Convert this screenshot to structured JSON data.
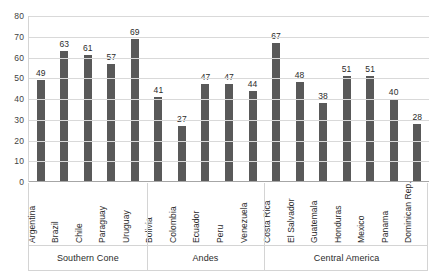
{
  "chart_data": {
    "type": "bar",
    "title": "",
    "subtitle": "",
    "xlabel": "",
    "ylabel": "",
    "ylim": [
      0,
      80
    ],
    "yticks": [
      0,
      10,
      20,
      30,
      40,
      50,
      60,
      70,
      80
    ],
    "grid": true,
    "legend": "none",
    "bar_color": "#595959",
    "gridline_color": "#d9d9d9",
    "axis_color": "#a6a6a6",
    "categories": [
      "Argentina",
      "Brazil",
      "Chile",
      "Paraguay",
      "Uruguay",
      "Bolivia",
      "Colombia",
      "Ecuador",
      "Peru",
      "Venezuela",
      "Costa Rica",
      "El Salvador",
      "Guatemala",
      "Honduras",
      "Mexico",
      "Panama",
      "Dominican Rep."
    ],
    "values": [
      49,
      63,
      61,
      57,
      69,
      41,
      27,
      47,
      47,
      44,
      67,
      48,
      38,
      51,
      51,
      40,
      28
    ],
    "groups": [
      {
        "label": "Southern Cone",
        "start": 0,
        "count": 5
      },
      {
        "label": "Andes",
        "start": 5,
        "count": 5
      },
      {
        "label": "Central America",
        "start": 10,
        "count": 7
      }
    ]
  }
}
